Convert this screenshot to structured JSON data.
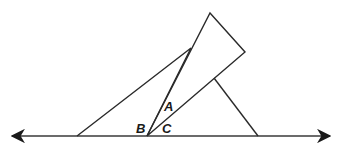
{
  "figure": {
    "type": "geometry",
    "labels": {
      "A": "A",
      "B": "B",
      "C": "C"
    },
    "colors": {
      "stroke": "#2a2a2a",
      "background": "#ffffff"
    }
  }
}
